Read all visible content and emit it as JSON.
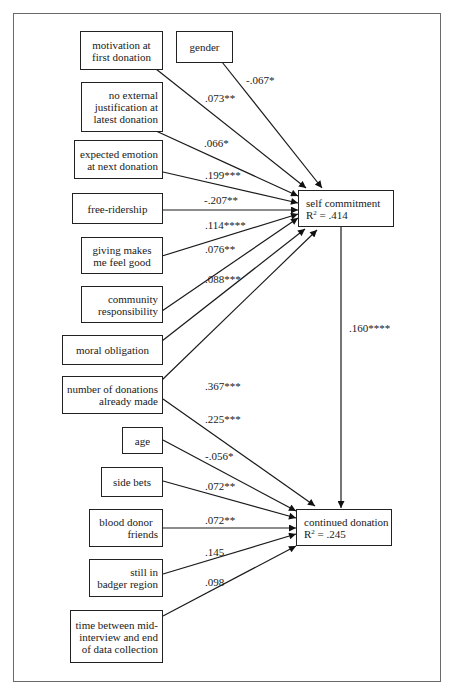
{
  "diagram": {
    "type": "path model",
    "outcomes": {
      "self_commitment": {
        "label": "self commitment",
        "r2_prefix": "R",
        "r2_sup": "2",
        "r2_value": " = .414"
      },
      "continued_donation": {
        "label": "continued donation",
        "r2_prefix": "R",
        "r2_sup": "2",
        "r2_value": " = .245"
      }
    },
    "predictors": {
      "motivation": {
        "lines": [
          "motivation at",
          "first donation"
        ]
      },
      "gender": {
        "lines": [
          "gender"
        ]
      },
      "no_external": {
        "lines": [
          "no external",
          "justification at",
          "latest donation"
        ]
      },
      "expected_emotion": {
        "lines": [
          "expected emotion",
          "at next donation"
        ]
      },
      "free_ridership": {
        "lines": [
          "free-ridership"
        ]
      },
      "giving_good": {
        "lines": [
          "giving makes",
          "me feel good"
        ]
      },
      "community": {
        "lines": [
          "community",
          "responsibility"
        ]
      },
      "moral": {
        "lines": [
          "moral obligation"
        ]
      },
      "num_donations": {
        "lines": [
          "number of donations",
          "already made"
        ]
      },
      "age": {
        "lines": [
          "age"
        ]
      },
      "side_bets": {
        "lines": [
          "side bets"
        ]
      },
      "friends": {
        "lines": [
          "blood donor",
          "friends"
        ]
      },
      "badger": {
        "lines": [
          "still in",
          "badger region"
        ]
      },
      "time_between": {
        "lines": [
          "time between mid-",
          "interview and end",
          "of data collection"
        ]
      }
    },
    "coefficients": {
      "gender_sc": "-.067*",
      "motivation_sc": ".073**",
      "no_external_sc": ".066*",
      "expected_emotion_sc": ".199***",
      "free_ridership_sc": "-.207**",
      "giving_good_sc": ".114****",
      "community_sc": ".076**",
      "moral_sc": ".088***",
      "num_donations_sc": ".367***",
      "num_donations_cd": ".225***",
      "age_cd": "-.056*",
      "side_bets_cd": ".072**",
      "friends_cd": ".072**",
      "badger_cd": ".145",
      "time_between_cd": ".098",
      "sc_cd": ".160****"
    }
  }
}
